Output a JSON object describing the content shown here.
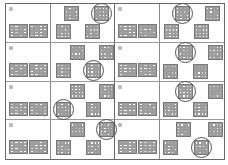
{
  "sheet": {
    "layout": {
      "rows": 4,
      "columns": 2
    },
    "panels": [
      {
        "marker": "panel-marker",
        "answer_position": "top-right",
        "options": [
          "top-left",
          "top-right",
          "bottom-left",
          "bottom-right"
        ]
      },
      {
        "marker": "panel-marker",
        "answer_position": "top-left",
        "options": [
          "top-left",
          "top-right",
          "bottom-left",
          "bottom-right"
        ]
      },
      {
        "marker": "panel-marker",
        "answer_position": "bottom-right",
        "options": [
          "top-left",
          "top-right",
          "bottom-left",
          "bottom-right"
        ]
      },
      {
        "marker": "panel-marker",
        "answer_position": "top-left",
        "options": [
          "top-left",
          "top-right",
          "bottom-left",
          "bottom-right"
        ]
      },
      {
        "marker": "panel-marker",
        "answer_position": "bottom-left",
        "options": [
          "top-left",
          "top-right",
          "bottom-left",
          "bottom-right"
        ]
      },
      {
        "marker": "panel-marker",
        "answer_position": "top-left",
        "options": [
          "top-left",
          "top-right",
          "bottom-left",
          "bottom-right"
        ]
      },
      {
        "marker": "panel-marker",
        "answer_position": "top-right",
        "options": [
          "top-left",
          "top-right",
          "bottom-left",
          "bottom-right"
        ]
      },
      {
        "marker": "panel-marker",
        "answer_position": "bottom-right",
        "options": [
          "top-left",
          "top-right",
          "bottom-left",
          "bottom-right"
        ]
      }
    ]
  },
  "colors": {
    "border": "#6a6a6a",
    "cell_fill": "#a9a9a9",
    "cell_light": "#d2d2d2",
    "circle": "#555555"
  }
}
